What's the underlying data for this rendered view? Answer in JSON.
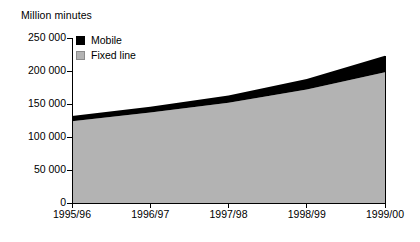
{
  "chart_data": {
    "type": "area",
    "title": "Million minutes",
    "subtitle": "",
    "xlabel": "",
    "ylabel": "Million minutes",
    "stacked": true,
    "grid": false,
    "legend_position": "top-left-inside",
    "categories": [
      "1995/96",
      "1996/97",
      "1997/98",
      "1998/99",
      "1999/00"
    ],
    "x_tick_labels": [
      "1995/96",
      "1996/97",
      "1997/98",
      "1998/99",
      "1999/00"
    ],
    "y_tick_labels": [
      "0",
      "50 000",
      "100 000",
      "150 000",
      "200 000",
      "250 000"
    ],
    "y_tick_values": [
      0,
      50000,
      100000,
      150000,
      200000,
      250000
    ],
    "ylim": [
      0,
      250000
    ],
    "series": [
      {
        "name": "Fixed line",
        "color": "#b3b3b3",
        "values": [
          124000,
          137000,
          152000,
          172000,
          198000
        ]
      },
      {
        "name": "Mobile",
        "color": "#000000",
        "values": [
          8000,
          9000,
          11000,
          16000,
          25000
        ]
      }
    ],
    "totals": [
      132000,
      146000,
      163000,
      188000,
      223000
    ],
    "annotations": []
  },
  "legend": {
    "items": [
      {
        "label": "Mobile",
        "color": "#000000"
      },
      {
        "label": "Fixed line",
        "color": "#b3b3b3"
      }
    ]
  },
  "axes": {
    "y_labels": [
      "250 000",
      "200 000",
      "150 000",
      "100 000",
      "50 000",
      "0"
    ],
    "x_labels": [
      "1995/96",
      "1996/97",
      "1997/98",
      "1998/99",
      "1999/00"
    ]
  },
  "colors": {
    "mobile": "#000000",
    "fixed_line": "#b3b3b3",
    "axis": "#000000",
    "background": "#ffffff"
  }
}
